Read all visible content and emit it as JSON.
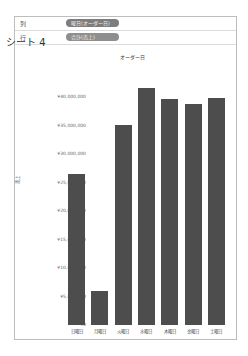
{
  "shelves": {
    "columns": {
      "label": "列",
      "pill": "曜日(オーダー日)"
    },
    "rows": {
      "label": "行",
      "pill": "合計(売上)"
    }
  },
  "sheet_title": "シート 4",
  "chart_data": {
    "type": "bar",
    "title": "シート 4",
    "header": "オーダー日",
    "xlabel": "",
    "ylabel": "売上",
    "categories": [
      "日曜日",
      "月曜日",
      "火曜日",
      "水曜日",
      "木曜日",
      "金曜日",
      "土曜日"
    ],
    "values": [
      26500000,
      6000000,
      35100000,
      41600000,
      39600000,
      38800000,
      39800000
    ],
    "ylim": [
      0,
      40000000
    ],
    "yticks": [
      "¥40,000,000",
      "¥35,000,000",
      "¥30,000,000",
      "¥25,000,000",
      "¥20,000,000",
      "¥15,000,000",
      "¥10,000,000",
      "¥5,000,000",
      "¥0"
    ],
    "grid": false,
    "legend": "none",
    "bar_color": "#4d4d4d"
  }
}
